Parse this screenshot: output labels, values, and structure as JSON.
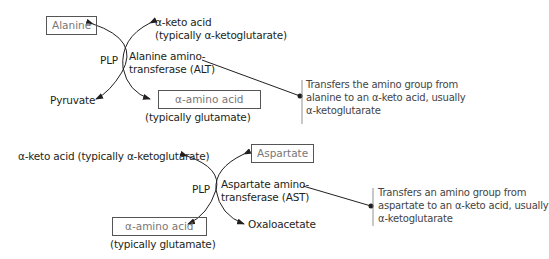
{
  "reactions": [
    {
      "enzyme_line1": "Alanine amino-",
      "enzyme_line2": "transferase (ALT)",
      "cofactor": "PLP",
      "substrate_boxed": "Alanine",
      "product_left": "Pyruvate",
      "acceptor_line1": "α-keto acid",
      "acceptor_line2": "(typically α-ketoglutarate)",
      "product_amino_boxed": "α-amino acid",
      "product_amino_note": "(typically glutamate)",
      "description_line1": "Transfers the amino group from",
      "description_line2": "alanine to an α-keto acid, usually",
      "description_line3": "α-ketoglutarate"
    },
    {
      "enzyme_line1": "Aspartate amino-",
      "enzyme_line2": "transferase (AST)",
      "cofactor": "PLP",
      "substrate_boxed": "Aspartate",
      "product_right": "Oxaloacetate",
      "acceptor": "α-keto acid (typically α-ketoglutarate)",
      "product_amino_boxed": "α-amino acid",
      "product_amino_note": "(typically glutamate)",
      "description_line1": "Transfers an amino group from",
      "description_line2": "aspartate to an α-keto acid, usually",
      "description_line3": "α-ketoglutarate"
    }
  ]
}
